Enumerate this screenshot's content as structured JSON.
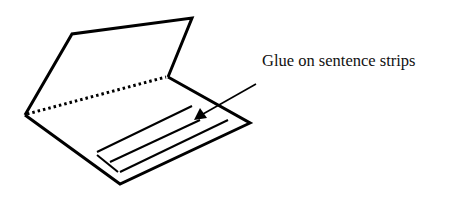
{
  "diagram": {
    "label": "Glue on sentence strips",
    "colors": {
      "stroke": "#000000",
      "background": "#ffffff"
    },
    "folder": {
      "top_flap": [
        [
          25,
          115
        ],
        [
          72,
          34
        ],
        [
          192,
          18
        ],
        [
          168,
          77
        ]
      ],
      "bottom_panel": [
        [
          25,
          115
        ],
        [
          168,
          77
        ],
        [
          250,
          123
        ],
        [
          120,
          184
        ]
      ],
      "fold_line": [
        [
          25,
          115
        ],
        [
          168,
          77
        ]
      ]
    },
    "strips": [
      [
        [
          97,
          152
        ],
        [
          192,
          106
        ]
      ],
      [
        [
          97,
          152
        ],
        [
          118,
          172
        ]
      ],
      [
        [
          110,
          162
        ],
        [
          200,
          116
        ]
      ],
      [
        [
          118,
          172
        ],
        [
          228,
          120
        ]
      ]
    ],
    "arrow": {
      "from": [
        256,
        84
      ],
      "to": [
        197,
        118
      ]
    }
  }
}
